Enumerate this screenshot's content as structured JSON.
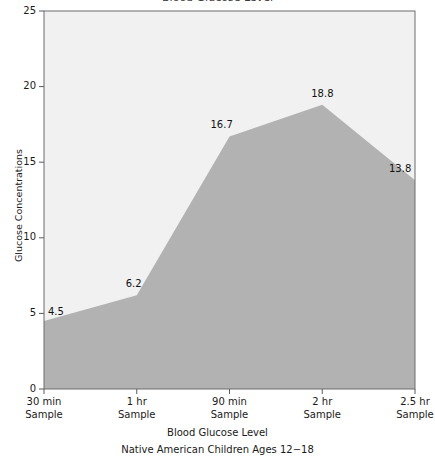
{
  "clipped_title": "Blood Glucose Level",
  "chart_data": {
    "type": "area",
    "title": "Blood Glucose Level",
    "subtitle": "Native American Children Ages 12−18",
    "xlabel": "",
    "ylabel": "Glucose Concentrations",
    "categories": [
      "30 min\nSample",
      "1 hr\nSample",
      "90 min\nSample",
      "2 hr\nSample",
      "2.5 hr\nSample"
    ],
    "category_lines": [
      {
        "top": "30 min",
        "bottom": "Sample"
      },
      {
        "top": "1 hr",
        "bottom": "Sample"
      },
      {
        "top": "90 min",
        "bottom": "Sample"
      },
      {
        "top": "2 hr",
        "bottom": "Sample"
      },
      {
        "top": "2.5 hr",
        "bottom": "Sample"
      }
    ],
    "values": [
      4.5,
      6.2,
      16.7,
      18.8,
      13.8
    ],
    "point_labels": [
      "4.5",
      "6.2",
      "16.7",
      "18.8",
      "13.8"
    ],
    "ylim": [
      0,
      25
    ],
    "yticks": [
      0,
      5,
      10,
      15,
      20,
      25
    ],
    "ytick_labels": [
      "0",
      "5",
      "10",
      "15",
      "20",
      "25"
    ],
    "grid": false,
    "legend": "none",
    "colors": {
      "area_fill": "#b2b2b2",
      "plot_background": "#f1f1f1",
      "axis": "#5a5a5a",
      "text": "#1a1a1a"
    }
  },
  "axis": {
    "y_title": "Glucose Concentrations"
  },
  "caption": {
    "line1": "Blood Glucose Level",
    "line2": "Native American Children Ages 12−18"
  }
}
